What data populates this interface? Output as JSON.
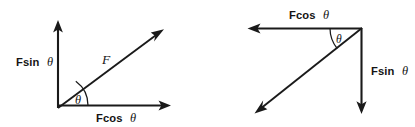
{
  "figure": {
    "background_color": "#ffffff",
    "stroke_color": "#1a1a1a",
    "text_color": "#141414"
  },
  "diagrams": [
    {
      "id": "left-diagram",
      "name": "force-up-right",
      "description": "Force F directed up and to the right from origin, resolved into Fcos theta horizontal and Fsin theta vertical components",
      "origin": {
        "x": 58,
        "y": 108
      },
      "vectors": [
        {
          "name": "vertical-component",
          "label": "Fsin θ",
          "label_text": "Fsin",
          "label_symbol": "θ",
          "direction": "up",
          "from": {
            "x": 58,
            "y": 108
          },
          "to": {
            "x": 58,
            "y": 22
          },
          "label_pos": {
            "x": 16,
            "y": 66
          }
        },
        {
          "name": "horizontal-component",
          "label": "Fcos θ",
          "label_text": "Fcos",
          "label_symbol": "θ",
          "direction": "right",
          "from": {
            "x": 58,
            "y": 105
          },
          "to": {
            "x": 170,
            "y": 105
          },
          "label_pos": {
            "x": 96,
            "y": 121
          }
        },
        {
          "name": "resultant-force",
          "label": "F",
          "label_text": "F",
          "direction": "up-right",
          "from": {
            "x": 58,
            "y": 108
          },
          "to": {
            "x": 163,
            "y": 30
          },
          "label_pos": {
            "x": 103,
            "y": 63
          }
        }
      ],
      "angle": {
        "name": "theta-angle",
        "symbol": "θ",
        "between": [
          "resultant-force",
          "horizontal-component"
        ],
        "label_pos": {
          "x": 79,
          "y": 103
        },
        "arc_radius": 30
      }
    },
    {
      "id": "right-diagram",
      "name": "force-down-left",
      "description": "Force directed down and to the left from the top-right vertex, resolved into Fcos theta leftward and Fsin theta downward components",
      "origin": {
        "x": 362,
        "y": 28
      },
      "vectors": [
        {
          "name": "horizontal-component",
          "label": "Fcos θ",
          "label_text": "Fcos",
          "label_symbol": "θ",
          "direction": "left",
          "from": {
            "x": 362,
            "y": 28
          },
          "to": {
            "x": 248,
            "y": 28
          },
          "label_pos": {
            "x": 290,
            "y": 18
          }
        },
        {
          "name": "vertical-component",
          "label": "Fsin θ",
          "label_text": "Fsin",
          "label_symbol": "θ",
          "direction": "down",
          "from": {
            "x": 362,
            "y": 28
          },
          "to": {
            "x": 362,
            "y": 113
          },
          "label_pos": {
            "x": 371,
            "y": 74
          }
        },
        {
          "name": "resultant-force",
          "label": "",
          "direction": "down-left",
          "from": {
            "x": 362,
            "y": 28
          },
          "to": {
            "x": 255,
            "y": 113
          }
        }
      ],
      "angle": {
        "name": "theta-angle",
        "symbol": "θ",
        "between": [
          "horizontal-component",
          "resultant-force"
        ],
        "label_pos": {
          "x": 340,
          "y": 42
        },
        "arc_radius": 32
      }
    }
  ],
  "labels": {
    "fsin_theta": "Fsin θ",
    "fcos_theta": "Fcos θ",
    "force_f": "F",
    "theta": "θ",
    "fsin_text": "Fsin",
    "fcos_text": "Fcos"
  }
}
